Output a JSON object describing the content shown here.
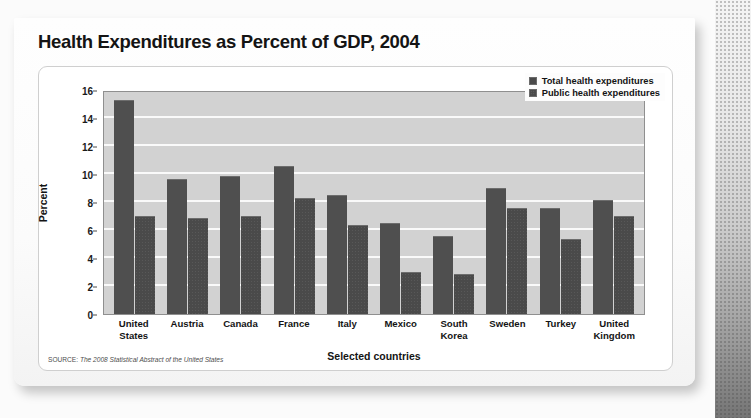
{
  "card": {
    "title": "Health Expenditures as Percent of GDP, 2004",
    "source_prefix": "SOURCE:",
    "source_title": "The 2008 Statistical Abstract of the United States"
  },
  "legend": {
    "items": [
      {
        "label": "Total health expenditures",
        "key": "total"
      },
      {
        "label": "Public health expenditures",
        "key": "public"
      }
    ]
  },
  "chart_data": {
    "type": "bar",
    "title": "Health Expenditures as Percent of GDP, 2004",
    "xlabel": "Selected countries",
    "ylabel": "Percent",
    "ylim": [
      0,
      16
    ],
    "yticks": [
      0,
      2,
      4,
      6,
      8,
      10,
      12,
      14,
      16
    ],
    "ytick_labels": [
      "0",
      "2",
      "4",
      "6",
      "8",
      "10",
      "12",
      "14",
      "16"
    ],
    "grid": true,
    "legend_position": "top-right",
    "categories": [
      "United States",
      "Austria",
      "Canada",
      "France",
      "Italy",
      "Mexico",
      "South Korea",
      "Sweden",
      "Turkey",
      "United Kingdom"
    ],
    "category_lines": [
      [
        "United",
        "States"
      ],
      [
        "Austria"
      ],
      [
        "Canada"
      ],
      [
        "France"
      ],
      [
        "Italy"
      ],
      [
        "Mexico"
      ],
      [
        "South",
        "Korea"
      ],
      [
        "Sweden"
      ],
      [
        "Turkey"
      ],
      [
        "United",
        "Kingdom"
      ]
    ],
    "series": [
      {
        "name": "Total health expenditures",
        "values": [
          15.2,
          9.6,
          9.8,
          10.5,
          8.4,
          6.4,
          5.5,
          8.9,
          7.5,
          8.1
        ]
      },
      {
        "name": "Public health expenditures",
        "values": [
          6.9,
          6.8,
          6.9,
          8.2,
          6.3,
          2.9,
          2.8,
          7.5,
          5.3,
          6.9
        ]
      }
    ],
    "colors": {
      "total": "#4f4f4f",
      "public": "#4a4a4a",
      "plot_background": "#d2d2d2",
      "gridline": "#fafafa"
    }
  }
}
